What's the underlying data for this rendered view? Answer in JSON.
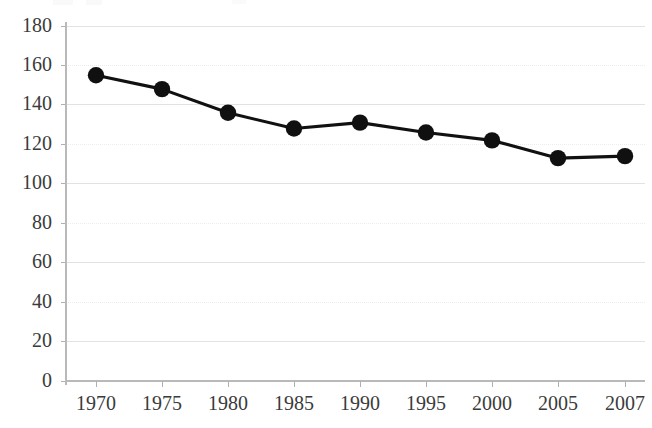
{
  "chart_data": {
    "type": "line",
    "title": "",
    "subtitle": "",
    "xlabel": "",
    "ylabel": "",
    "categories": [
      "1970",
      "1975",
      "1980",
      "1985",
      "1990",
      "1995",
      "2000",
      "2005",
      "2007"
    ],
    "values": [
      155,
      148,
      136,
      128,
      131,
      126,
      122,
      113,
      114
    ],
    "series": [
      {
        "name": "",
        "values": [
          155,
          148,
          136,
          128,
          131,
          126,
          122,
          113,
          114
        ]
      }
    ],
    "ylim": [
      0,
      180
    ],
    "y_ticks": [
      0,
      20,
      40,
      60,
      80,
      100,
      120,
      140,
      160,
      180
    ],
    "y_tick_labels": [
      "0",
      "20",
      "40",
      "60",
      "80",
      "100",
      "120",
      "140",
      "160",
      "180"
    ],
    "x_tick_labels": [
      "1970",
      "1975",
      "1980",
      "1985",
      "1990",
      "1995",
      "2000",
      "2005",
      "2007"
    ],
    "grid": true,
    "grid_axis": "y",
    "legend": false,
    "legend_position": "none",
    "marker": "circle",
    "marker_color": "#101010",
    "line_color": "#111111",
    "background_color": "#ffffff",
    "gridline_color": "#e2e2e2",
    "axis_color": "#b9b9b9",
    "tick_label_color": "#3b3b3b",
    "annotations": []
  },
  "plot_geometry": {
    "left": 66,
    "right": 645,
    "top": 26,
    "bottom": 381,
    "y_min": 0,
    "y_max": 180,
    "x_positions": [
      96,
      162,
      228,
      294,
      360,
      426,
      492,
      558,
      625
    ]
  }
}
